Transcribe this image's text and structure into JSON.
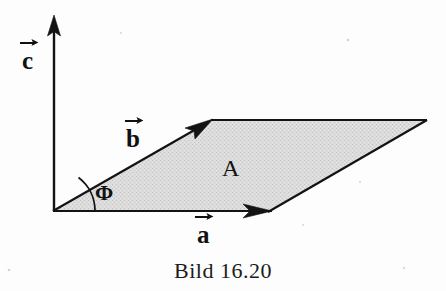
{
  "figure": {
    "caption": "Bild 16.20",
    "background_color": "#fdfdfd",
    "ink_color": "#111111",
    "fill_color": "#d8d8d8",
    "labels": {
      "axis_c": "c",
      "vector_b": "b",
      "vector_a": "a",
      "angle": "Φ",
      "area": "A"
    },
    "geometry": {
      "origin": [
        53,
        211
      ],
      "c_axis_tip": [
        54,
        17
      ],
      "vector_a_tip": [
        268,
        211
      ],
      "vector_b_tip": [
        211,
        121
      ],
      "parallelogram_far_corner": [
        426,
        120
      ],
      "angle_arc_radius": 42
    }
  }
}
